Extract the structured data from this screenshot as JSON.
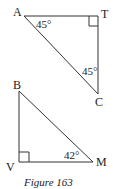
{
  "figure": {
    "caption": "Figure 163",
    "triangles": [
      {
        "name": "ATC",
        "vertices": {
          "A": "A",
          "T": "T",
          "C": "C"
        },
        "right_angle_at": "T",
        "angles": {
          "A": "45°",
          "C": "45°"
        }
      },
      {
        "name": "BVM",
        "vertices": {
          "B": "B",
          "V": "V",
          "M": "M"
        },
        "right_angle_at": "V",
        "angles": {
          "M": "42°"
        }
      }
    ]
  }
}
